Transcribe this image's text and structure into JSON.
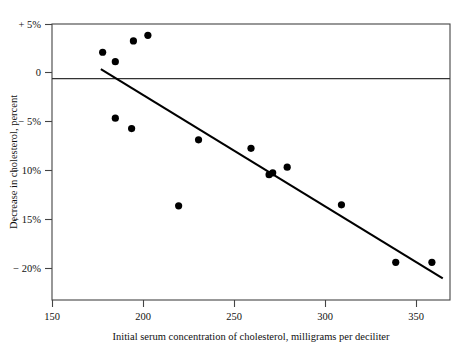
{
  "chart_data": {
    "type": "scatter",
    "title": "",
    "xlabel": "Initial serum concentration of cholesterol, milligrams per deciliter",
    "ylabel": "Decrease in cholesterol, percent",
    "xlim": [
      150,
      370
    ],
    "ylim": [
      -23.5,
      5.8
    ],
    "xticks": [
      150,
      200,
      250,
      300,
      350
    ],
    "xtick_labels": [
      "150",
      "200",
      "250",
      "300",
      "350"
    ],
    "yticks": [
      5,
      0,
      -5,
      -10,
      -15,
      -20
    ],
    "ytick_labels": [
      "+ 5%",
      "0",
      "− 5%",
      "− 10%",
      "− 15%",
      "− 20%"
    ],
    "grid": false,
    "legend": "none",
    "points": [
      {
        "x": 178,
        "y": 2.8
      },
      {
        "x": 185,
        "y": 1.8
      },
      {
        "x": 195,
        "y": 4.0
      },
      {
        "x": 203,
        "y": 4.6
      },
      {
        "x": 185,
        "y": -4.2
      },
      {
        "x": 194,
        "y": -5.3
      },
      {
        "x": 220,
        "y": -13.5
      },
      {
        "x": 231,
        "y": -6.5
      },
      {
        "x": 260,
        "y": -7.4
      },
      {
        "x": 270,
        "y": -10.2
      },
      {
        "x": 272,
        "y": -10.0
      },
      {
        "x": 280,
        "y": -9.4
      },
      {
        "x": 310,
        "y": -13.4
      },
      {
        "x": 340,
        "y": -19.5
      },
      {
        "x": 360,
        "y": -19.5
      }
    ],
    "reference_line": {
      "name": "zero-line",
      "y": 0
    },
    "trend_line": {
      "name": "regression-line",
      "x_start": 177,
      "y_start": 1.0,
      "x_end": 366,
      "y_end": -21.2
    }
  }
}
